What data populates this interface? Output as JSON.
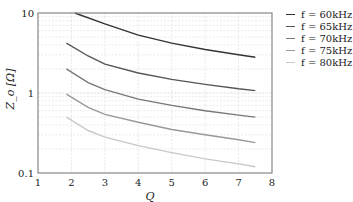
{
  "chart_data": {
    "type": "line",
    "title": "",
    "xlabel": "Q",
    "ylabel": "Z_o [Ω]",
    "xlim": [
      1,
      8
    ],
    "ylim": [
      0.1,
      10
    ],
    "yscale": "log",
    "grid": true,
    "legend_position": "right",
    "x_ticks": [
      "1",
      "2",
      "3",
      "4",
      "5",
      "6",
      "7",
      "8"
    ],
    "y_ticks": [
      "0.1",
      "1",
      "10"
    ],
    "x": [
      1.85,
      2.1,
      3,
      4,
      5,
      6,
      7,
      7.5
    ],
    "series": [
      {
        "name": "f = 60kHz",
        "color": "#333333",
        "x": [
          2.1,
          3,
          4,
          5,
          6,
          7,
          7.5
        ],
        "values": [
          10.0,
          7.3,
          5.3,
          4.2,
          3.5,
          3.0,
          2.8
        ]
      },
      {
        "name": "f = 65kHz",
        "color": "#555555",
        "x": [
          1.85,
          2.5,
          3,
          4,
          5,
          6,
          7,
          7.5
        ],
        "values": [
          4.2,
          2.9,
          2.3,
          1.78,
          1.48,
          1.28,
          1.13,
          1.07
        ]
      },
      {
        "name": "f = 70kHz",
        "color": "#777777",
        "x": [
          1.85,
          2.5,
          3,
          4,
          5,
          6,
          7,
          7.5
        ],
        "values": [
          2.0,
          1.35,
          1.1,
          0.84,
          0.7,
          0.6,
          0.53,
          0.5
        ]
      },
      {
        "name": "f = 75kHz",
        "color": "#999999",
        "x": [
          1.85,
          2.5,
          3,
          4,
          5,
          6,
          7,
          7.5
        ],
        "values": [
          0.97,
          0.66,
          0.54,
          0.43,
          0.35,
          0.3,
          0.26,
          0.24
        ]
      },
      {
        "name": "f = 80kHz",
        "color": "#c8c8c8",
        "x": [
          1.85,
          2.5,
          3,
          4,
          5,
          6,
          7,
          7.5
        ],
        "values": [
          0.5,
          0.34,
          0.28,
          0.22,
          0.18,
          0.15,
          0.13,
          0.12
        ]
      }
    ]
  },
  "legend": {
    "items": [
      {
        "label": "f = 60kHz",
        "color": "#333333"
      },
      {
        "label": "f = 65kHz",
        "color": "#555555"
      },
      {
        "label": "f = 70kHz",
        "color": "#777777"
      },
      {
        "label": "f = 75kHz",
        "color": "#999999"
      },
      {
        "label": "f = 80kHz",
        "color": "#c8c8c8"
      }
    ]
  },
  "axes": {
    "xlabel": "Q",
    "ylabel": "Z_o [Ω]"
  }
}
